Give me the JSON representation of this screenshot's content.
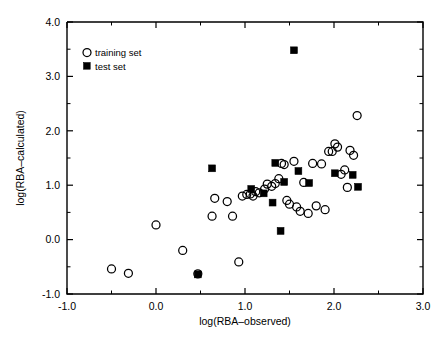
{
  "chart_data": {
    "type": "scatter",
    "title": "",
    "xlabel": "log(RBA–observed)",
    "ylabel": "log(RBA–calculated)",
    "xlim": [
      -1.0,
      3.0
    ],
    "ylim": [
      -1.0,
      4.0
    ],
    "xticks": [
      -1.0,
      0.0,
      1.0,
      2.0,
      3.0
    ],
    "xticklabels": [
      "-1.0",
      "0.0",
      "1.0",
      "2.0",
      "3.0"
    ],
    "yticks": [
      -1.0,
      0.0,
      1.0,
      2.0,
      3.0,
      4.0
    ],
    "yticklabels": [
      "-1.0",
      "0.0",
      "1.0",
      "2.0",
      "3.0",
      "4.0"
    ],
    "xminor_ticks": [
      -0.5,
      0.5,
      1.5,
      2.5
    ],
    "yminor_ticks": [
      -0.5,
      0.5,
      1.5,
      2.5,
      3.5
    ],
    "grid": false,
    "legend_position": "upper-left-inside",
    "series": [
      {
        "name": "training set",
        "marker": "open-circle",
        "color": "#000000",
        "points": [
          [
            -0.5,
            -0.54
          ],
          [
            -0.31,
            -0.62
          ],
          [
            0.0,
            0.27
          ],
          [
            0.3,
            -0.2
          ],
          [
            0.47,
            -0.63
          ],
          [
            0.63,
            0.43
          ],
          [
            0.66,
            0.76
          ],
          [
            0.8,
            0.7
          ],
          [
            0.86,
            0.43
          ],
          [
            0.93,
            -0.41
          ],
          [
            0.97,
            0.8
          ],
          [
            1.02,
            0.83
          ],
          [
            1.06,
            0.84
          ],
          [
            1.09,
            0.8
          ],
          [
            1.12,
            0.88
          ],
          [
            1.16,
            0.86
          ],
          [
            1.22,
            0.93
          ],
          [
            1.25,
            1.02
          ],
          [
            1.3,
            0.98
          ],
          [
            1.34,
            1.03
          ],
          [
            1.38,
            1.12
          ],
          [
            1.41,
            1.4
          ],
          [
            1.44,
            1.38
          ],
          [
            1.47,
            0.72
          ],
          [
            1.5,
            0.65
          ],
          [
            1.55,
            1.44
          ],
          [
            1.58,
            0.6
          ],
          [
            1.62,
            0.52
          ],
          [
            1.66,
            1.05
          ],
          [
            1.71,
            0.48
          ],
          [
            1.76,
            1.4
          ],
          [
            1.8,
            0.62
          ],
          [
            1.86,
            1.39
          ],
          [
            1.9,
            0.55
          ],
          [
            1.94,
            1.62
          ],
          [
            1.98,
            1.62
          ],
          [
            2.01,
            1.76
          ],
          [
            2.04,
            1.7
          ],
          [
            2.08,
            1.2
          ],
          [
            2.12,
            1.28
          ],
          [
            2.15,
            0.96
          ],
          [
            2.18,
            1.64
          ],
          [
            2.22,
            1.55
          ],
          [
            2.26,
            2.28
          ]
        ]
      },
      {
        "name": "test set",
        "marker": "filled-square",
        "color": "#000000",
        "points": [
          [
            0.47,
            -0.64
          ],
          [
            0.63,
            1.31
          ],
          [
            1.07,
            0.93
          ],
          [
            1.21,
            0.85
          ],
          [
            1.31,
            0.68
          ],
          [
            1.34,
            1.41
          ],
          [
            1.4,
            0.16
          ],
          [
            1.44,
            1.06
          ],
          [
            1.55,
            3.48
          ],
          [
            1.6,
            1.26
          ],
          [
            1.72,
            1.04
          ],
          [
            2.01,
            1.22
          ],
          [
            2.21,
            1.19
          ],
          [
            2.27,
            0.97
          ]
        ]
      }
    ],
    "legend": [
      {
        "label": "training set",
        "marker": "open-circle"
      },
      {
        "label": "test set",
        "marker": "filled-square"
      }
    ]
  },
  "figure": {
    "plot_left_px": 67,
    "plot_right_px": 423,
    "plot_top_px": 22,
    "plot_bottom_px": 294
  }
}
